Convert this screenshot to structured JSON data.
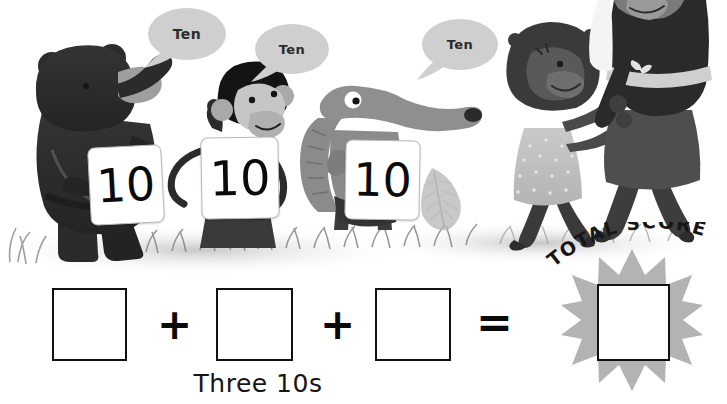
{
  "page": {
    "background_color": "#ffffff"
  },
  "scene": {
    "speech_bubbles": [
      {
        "id": "bubble-bear",
        "text": "Ten"
      },
      {
        "id": "bubble-monkey",
        "text": "Ten"
      },
      {
        "id": "bubble-anteater",
        "text": "Ten"
      }
    ],
    "characters": [
      {
        "id": "bear",
        "name": "bear",
        "card_value": "10"
      },
      {
        "id": "monkey",
        "name": "monkey",
        "card_value": "10"
      },
      {
        "id": "anteater",
        "name": "anteater",
        "card_value": "10"
      },
      {
        "id": "child",
        "name": "child-in-polka-dot-dress",
        "card_value": ""
      },
      {
        "id": "adult",
        "name": "adult-walking",
        "card_value": ""
      }
    ],
    "number_cards": [
      {
        "id": "card-bear",
        "value": "10"
      },
      {
        "id": "card-monkey",
        "value": "10"
      },
      {
        "id": "card-anteater",
        "value": "10"
      }
    ]
  },
  "equation": {
    "addend_1": "",
    "operator_1": "+",
    "addend_2": "",
    "operator_2": "+",
    "addend_3": "",
    "operator_equals": "=",
    "result": "",
    "caption": "Three 10s",
    "total_score_label": "TOTAL SCORE",
    "total_score_letters": [
      "T",
      "O",
      "T",
      "A",
      "L",
      " ",
      "S",
      "C",
      "O",
      "R",
      "E"
    ]
  },
  "colors": {
    "ink": "#111111",
    "bubble_fill": "#cfcfcf",
    "bubble_text": "#2b2b2b",
    "starburst": "#b3b3b3",
    "bear_dark": "#2e2e2e",
    "bear_muzzle": "#9a9a9a",
    "anteater_gray": "#8f8f8f",
    "ground_gray": "#bdbdbd",
    "card_white": "#ffffff"
  }
}
